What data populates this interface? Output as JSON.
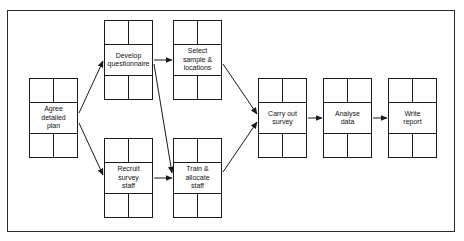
{
  "diagram": {
    "frame": {
      "name": "diagram-border"
    },
    "stroke_color": "#1a1a1a",
    "background_color": "#ffffff",
    "nodes": [
      {
        "id": "agree-detailed-plan",
        "label": "Agree\ndetailed\nplan",
        "x": 29,
        "y": 78
      },
      {
        "id": "develop-questionnaire",
        "label": "Develop\nquestionnaire",
        "x": 104,
        "y": 20
      },
      {
        "id": "select-sample",
        "label": "Select\nsample &\nlocations",
        "x": 173,
        "y": 20
      },
      {
        "id": "recruit-survey-staff",
        "label": "Recruit\nsurvey\nstaff",
        "x": 104,
        "y": 138
      },
      {
        "id": "train-allocate-staff",
        "label": "Train &\nallocate\nstaff",
        "x": 173,
        "y": 138
      },
      {
        "id": "carry-out-survey",
        "label": "Carry out\nsurvey",
        "x": 258,
        "y": 78
      },
      {
        "id": "analyse-data",
        "label": "Analyse\ndata",
        "x": 323,
        "y": 78
      },
      {
        "id": "write-report",
        "label": "Write\nreport",
        "x": 388,
        "y": 78
      }
    ],
    "edges": [
      {
        "id": "edge-plan-to-questionnaire",
        "from": "agree-detailed-plan",
        "to": "develop-questionnaire",
        "x1": 79,
        "y1": 113,
        "x2": 103,
        "y2": 61
      },
      {
        "id": "edge-plan-to-recruit",
        "from": "agree-detailed-plan",
        "to": "recruit-survey-staff",
        "x1": 79,
        "y1": 123,
        "x2": 103,
        "y2": 175
      },
      {
        "id": "edge-questionnaire-to-sample",
        "from": "develop-questionnaire",
        "to": "select-sample",
        "x1": 154,
        "y1": 60,
        "x2": 172,
        "y2": 60
      },
      {
        "id": "edge-questionnaire-to-train",
        "from": "develop-questionnaire",
        "to": "train-allocate-staff",
        "x1": 154,
        "y1": 64,
        "x2": 172,
        "y2": 173
      },
      {
        "id": "edge-recruit-to-train",
        "from": "recruit-survey-staff",
        "to": "train-allocate-staff",
        "x1": 154,
        "y1": 178,
        "x2": 172,
        "y2": 178
      },
      {
        "id": "edge-sample-to-survey",
        "from": "select-sample",
        "to": "carry-out-survey",
        "x1": 223,
        "y1": 64,
        "x2": 257,
        "y2": 114
      },
      {
        "id": "edge-train-to-survey",
        "from": "train-allocate-staff",
        "to": "carry-out-survey",
        "x1": 223,
        "y1": 172,
        "x2": 257,
        "y2": 122
      },
      {
        "id": "edge-survey-to-analyse",
        "from": "carry-out-survey",
        "to": "analyse-data",
        "x1": 308,
        "y1": 118,
        "x2": 322,
        "y2": 118
      },
      {
        "id": "edge-analyse-to-report",
        "from": "analyse-data",
        "to": "write-report",
        "x1": 373,
        "y1": 118,
        "x2": 387,
        "y2": 118
      }
    ]
  }
}
